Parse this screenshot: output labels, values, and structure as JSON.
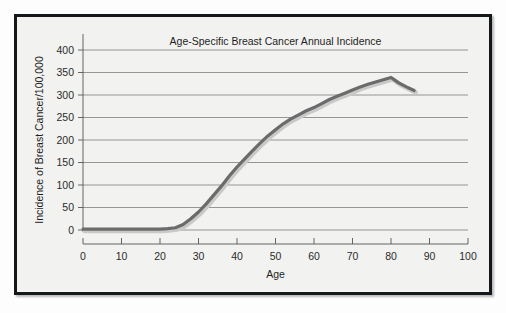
{
  "figure": {
    "background_color": "#f2f2f0",
    "border_color": "#15181a",
    "page_color": "#ffffff"
  },
  "chart_data": {
    "type": "line",
    "title": "Age-Specific Breast Cancer Annual Incidence",
    "xlabel": "Age",
    "ylabel": "Incidence of Breast Cancer/100,000",
    "xlim": [
      0,
      100
    ],
    "ylim": [
      0,
      400
    ],
    "xticks": [
      0,
      10,
      20,
      30,
      40,
      50,
      60,
      70,
      80,
      90,
      100
    ],
    "xtick_labels": [
      "0",
      "10",
      "20",
      "30",
      "40",
      "50",
      "60",
      "70",
      "80",
      "90",
      "100"
    ],
    "yticks": [
      0,
      50,
      100,
      150,
      200,
      250,
      300,
      350,
      400
    ],
    "ytick_labels": [
      "0",
      "50",
      "100",
      "150",
      "200",
      "250",
      "300",
      "350",
      "400"
    ],
    "grid": "horizontal",
    "grid_color": "#6f6f6f",
    "legend": "none",
    "series": [
      {
        "name": "Breast cancer incidence",
        "color": "#6b6b6b",
        "line_width": 3.2,
        "shadow": true,
        "x": [
          0,
          5,
          10,
          15,
          20,
          22,
          24,
          26,
          28,
          30,
          32,
          34,
          36,
          38,
          40,
          42,
          44,
          46,
          48,
          50,
          52,
          54,
          56,
          58,
          60,
          62,
          64,
          66,
          68,
          70,
          72,
          74,
          76,
          78,
          80,
          82,
          84,
          86
        ],
        "y": [
          2,
          2,
          2,
          2,
          2,
          3,
          5,
          12,
          25,
          40,
          58,
          78,
          98,
          120,
          140,
          158,
          176,
          193,
          209,
          223,
          236,
          247,
          256,
          265,
          272,
          281,
          290,
          297,
          304,
          311,
          318,
          324,
          329,
          334,
          339,
          327,
          318,
          310
        ]
      }
    ]
  },
  "geometry": {
    "plot_left": 83,
    "plot_right": 468,
    "plot_top": 50,
    "plot_bottom": 230
  }
}
